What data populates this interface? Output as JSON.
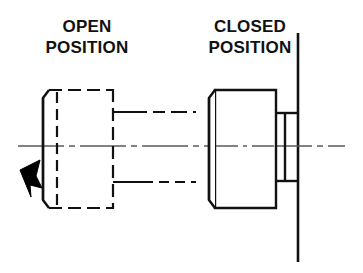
{
  "diagram": {
    "type": "mechanical-cross-section",
    "title_left": "OPEN\nPOSITION",
    "title_right": "CLOSED\nPOSITION",
    "background_color": "#ffffff",
    "line_color": "#111111",
    "centerline_color": "#4a4a4a",
    "arrow_color": "#000000",
    "labels": {
      "open_line1": "OPEN",
      "open_line2": "POSITION",
      "closed_line1": "CLOSED",
      "closed_line2": "POSITION"
    },
    "components": {
      "open_body": {
        "name": "valve-body-open",
        "style": "dashed",
        "description": "hidden-outline valve body shown in retracted open position"
      },
      "closed_body": {
        "name": "valve-body-closed",
        "style": "solid",
        "description": "visible-outline valve body seated against wall in closed position"
      },
      "seat_stub": {
        "name": "seat-stub",
        "style": "solid",
        "description": "small seating flange between closed body and wall"
      },
      "shaft_upper": {
        "name": "shaft-line-upper",
        "style": "dash-dot"
      },
      "shaft_lower": {
        "name": "shaft-line-lower",
        "style": "dash-dot"
      },
      "centerline": {
        "name": "axis-centerline",
        "style": "dash-dot"
      },
      "wall": {
        "name": "wall-line",
        "style": "solid"
      },
      "motion_arrow": {
        "name": "motion-arrow",
        "style": "filled",
        "direction": "left"
      }
    }
  }
}
